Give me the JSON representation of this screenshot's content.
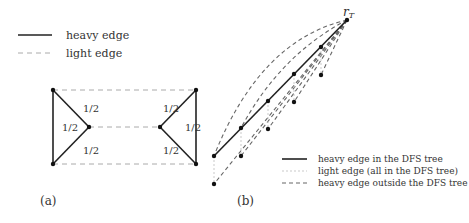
{
  "legend_a": {
    "items": [
      {
        "style": "heavy",
        "label": "heavy edge"
      },
      {
        "style": "light",
        "label": "light edge"
      }
    ]
  },
  "diagram_a": {
    "caption": "(a)",
    "nodes": {
      "tl": [
        53,
        90
      ],
      "ml": [
        89,
        127
      ],
      "bl": [
        53,
        164
      ],
      "tr": [
        196,
        90
      ],
      "mr": [
        160,
        127
      ],
      "br": [
        196,
        164
      ]
    },
    "weights": {
      "left_upper": "1/2",
      "left_vertical": "1/2",
      "left_lower": "1/2",
      "right_upper": "1/2",
      "right_vertical": "1/2",
      "right_lower": "1/2"
    }
  },
  "diagram_b": {
    "caption": "(b)",
    "root_label": "r",
    "root_label_sub": "T",
    "legend": [
      {
        "style": "heavy",
        "label": "heavy edge in the DFS tree"
      },
      {
        "style": "light",
        "label": "light edge (all in the DFS tree)"
      },
      {
        "style": "heavydash",
        "label": "heavy edge outside the DFS tree"
      }
    ]
  }
}
